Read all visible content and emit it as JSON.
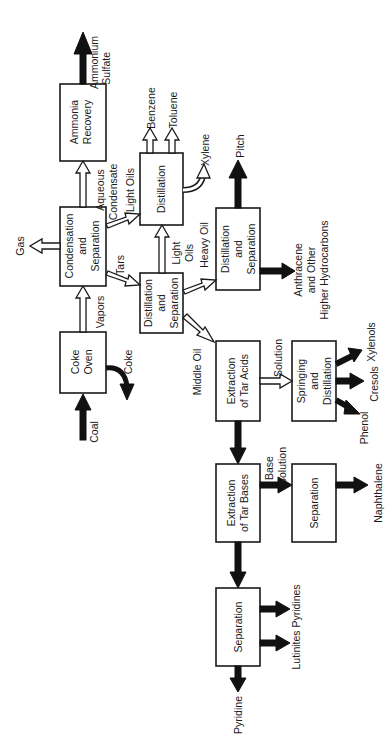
{
  "diagram": {
    "orientation": "rotated 90 degrees clockwise",
    "colors": {
      "stroke": "#1a1a1a",
      "fill": "#ffffff",
      "solid_arrow": "#111111"
    },
    "boxes": {
      "ammonia_recovery": {
        "line1": "Ammonia",
        "line2": "Recovery"
      },
      "condensation": {
        "line1": "Condensation",
        "line2": "and",
        "line3": "Separation"
      },
      "coke_oven": {
        "line1": "Coke",
        "line2": "Oven"
      },
      "distillation_top": {
        "line1": "Distillation"
      },
      "distillation_sep_mid": {
        "line1": "Distillation",
        "line2": "and",
        "line3": "Separation"
      },
      "distillation_sep_right": {
        "line1": "Distillation",
        "line2": "and",
        "line3": "Separation"
      },
      "extraction_tar_acids": {
        "line1": "Extraction",
        "line2": "of Tar Acids"
      },
      "springing": {
        "line1": "Springing",
        "line2": "and",
        "line3": "Distillation"
      },
      "extraction_tar_bases": {
        "line1": "Extraction",
        "line2": "of Tar Bases"
      },
      "separation_naphthalene": {
        "line1": "Separation"
      },
      "separation_pyridine": {
        "line1": "Separation"
      }
    },
    "flows": {
      "coal": "Coal",
      "coke": "Coke",
      "vapors": "Vapors",
      "gas": "Gas",
      "tars": "Tars",
      "aqueous_condensate_1": "Aqueous",
      "aqueous_condensate_2": "Condensate",
      "light_oils_top": "Light Oils",
      "ammonium_sulfate_1": "Ammonium",
      "ammonium_sulfate_2": "Sulfate",
      "benzene": "Benzene",
      "toluene": "Toluene",
      "xylene": "Xylene",
      "light_oils_mid_1": "Light",
      "light_oils_mid_2": "Oils",
      "heavy_oil": "Heavy Oil",
      "pitch": "Pitch",
      "anthracene_1": "Anthracene",
      "anthracene_2": "and Other",
      "anthracene_3": "Higher Hydrocarbons",
      "middle_oil": "Middle Oil",
      "solution": "Solution",
      "xylenols": "Xylenols",
      "cresols": "Cresols",
      "phenol": "Phenol",
      "base_solution_1": "Base",
      "base_solution_2": "Solution",
      "naphthalene": "Naphthalene",
      "pyridines": "Pyridines",
      "lutinites": "Lutinites",
      "pyridine": "Pyridine"
    }
  }
}
